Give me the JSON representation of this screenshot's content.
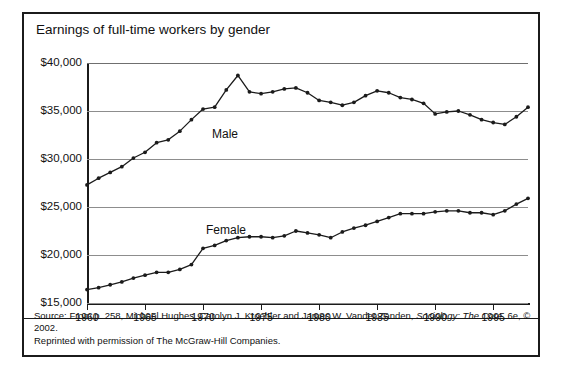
{
  "figure": {
    "title": "Earnings of full-time workers by gender",
    "top_cutoff_text": "",
    "source_line1_pre": "Source: From p. 258, Michael Hughes, Carolyn J. Kroehler and James W. Vander Zanden, ",
    "source_line1_italic": "Sociology: The Core",
    "source_line1_post": ", 6e, © 2002.",
    "source_line2": "Reprinted with permission of The McGraw-Hill Companies."
  },
  "colors": {
    "line": "#1b1b1b",
    "grid": "#8d8d8d",
    "axis": "#1b1b1b",
    "border": "#1b1b1b",
    "background": "#ffffff"
  },
  "chart_data": {
    "type": "line",
    "title": "Earnings of full-time workers by gender",
    "xlabel": "",
    "ylabel": "",
    "xlim": [
      1960,
      1998
    ],
    "ylim": [
      15000,
      40000
    ],
    "ytick_labels": [
      "$40,000",
      "$35,000",
      "$30,000",
      "$25,000",
      "$20,000",
      "$15,000"
    ],
    "ytick_values": [
      40000,
      35000,
      30000,
      25000,
      20000,
      15000
    ],
    "xtick_labels": [
      "1960",
      "1965",
      "1970",
      "1975",
      "1980",
      "1985",
      "1990",
      "1995"
    ],
    "xtick_values": [
      1960,
      1965,
      1970,
      1975,
      1980,
      1985,
      1990,
      1995
    ],
    "grid": true,
    "legend": "inline-labels",
    "markers": true,
    "x": [
      1960,
      1961,
      1962,
      1963,
      1964,
      1965,
      1966,
      1967,
      1968,
      1969,
      1970,
      1971,
      1972,
      1973,
      1974,
      1975,
      1976,
      1977,
      1978,
      1979,
      1980,
      1981,
      1982,
      1983,
      1984,
      1985,
      1986,
      1987,
      1988,
      1989,
      1990,
      1991,
      1992,
      1993,
      1994,
      1995,
      1996,
      1997,
      1998
    ],
    "series": [
      {
        "name": "Male",
        "label": "Male",
        "values": [
          27300,
          28000,
          28600,
          29200,
          30100,
          30700,
          31700,
          32000,
          32900,
          34100,
          35200,
          35400,
          37200,
          38700,
          37000,
          36800,
          37000,
          37300,
          37400,
          36900,
          36100,
          35900,
          35600,
          35900,
          36600,
          37100,
          36900,
          36400,
          36200,
          35800,
          34700,
          34900,
          35000,
          34600,
          34100,
          33800,
          33600,
          34400,
          35400
        ]
      },
      {
        "name": "Female",
        "label": "Female",
        "values": [
          16400,
          16600,
          16900,
          17200,
          17600,
          17900,
          18200,
          18200,
          18500,
          19000,
          20700,
          21000,
          21500,
          21800,
          21900,
          21900,
          21800,
          22000,
          22500,
          22300,
          22100,
          21800,
          22400,
          22800,
          23100,
          23500,
          23900,
          24300,
          24300,
          24300,
          24500,
          24600,
          24600,
          24400,
          24400,
          24200,
          24600,
          25300,
          25900
        ]
      }
    ]
  }
}
